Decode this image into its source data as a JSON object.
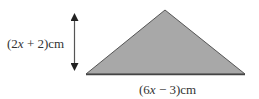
{
  "diagram": {
    "shape": "triangle",
    "fill_color": "#a8a8a8",
    "stroke_color": "#555555",
    "arrow_color": "#222222",
    "height_label": {
      "open": "(2",
      "var": "x",
      "rest": " + 2)cm"
    },
    "base_label": {
      "open": "(6",
      "var": "x",
      "rest": " − 3)cm"
    }
  }
}
